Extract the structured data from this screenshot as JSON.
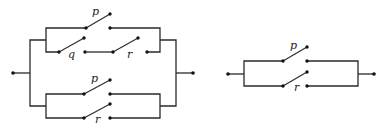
{
  "diagram": {
    "type": "switching-circuit",
    "circuits": [
      {
        "name": "left-circuit",
        "description": "Two parallel branches: top branch = p parallel (q series r); bottom branch = p parallel r",
        "switches": [
          {
            "label": "p",
            "branch": "upper-top"
          },
          {
            "label": "q",
            "branch": "upper-bottom"
          },
          {
            "label": "r",
            "branch": "upper-bottom"
          },
          {
            "label": "p",
            "branch": "lower-top"
          },
          {
            "label": "r",
            "branch": "lower-bottom"
          }
        ]
      },
      {
        "name": "right-circuit",
        "description": "p parallel r",
        "switches": [
          {
            "label": "p",
            "branch": "top"
          },
          {
            "label": "r",
            "branch": "bottom"
          }
        ]
      }
    ]
  },
  "labels": {
    "l_p1": "p",
    "l_q": "q",
    "l_r1": "r",
    "l_p2": "p",
    "l_r2": "r",
    "r_p": "p",
    "r_r": "r"
  }
}
